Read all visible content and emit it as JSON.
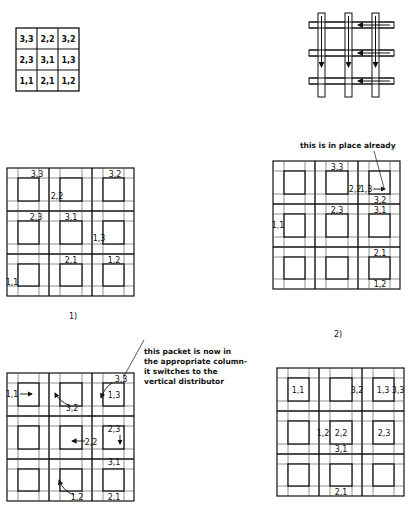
{
  "matrix": {
    "rows": [
      [
        "3,3",
        "2,2",
        "3,2"
      ],
      [
        "2,3",
        "3,1",
        "1,3"
      ],
      [
        "1,1",
        "2,1",
        "1,2"
      ]
    ]
  },
  "crossbar": {
    "description": "3 vertical buses crossed by 3 horizontal buses; horizontal arrows point left, vertical arrows point down"
  },
  "panels": [
    {
      "caption": "1)",
      "packets": [
        {
          "label": "3,3"
        },
        {
          "label": "2,2"
        },
        {
          "label": "3,2"
        },
        {
          "label": "2,3"
        },
        {
          "label": "3,1"
        },
        {
          "label": "1,3"
        },
        {
          "label": "2,1"
        },
        {
          "label": "1,2"
        },
        {
          "label": "1,1"
        }
      ]
    },
    {
      "caption": "2)",
      "annotation": "this is in place already",
      "packets": [
        {
          "label": "3,3"
        },
        {
          "label": "2,2"
        },
        {
          "label": "1,3"
        },
        {
          "label": "3,2"
        },
        {
          "label": "2,3"
        },
        {
          "label": "3,1"
        },
        {
          "label": "1,1"
        },
        {
          "label": "2,1"
        },
        {
          "label": "1,2"
        }
      ]
    },
    {
      "caption": "",
      "annotation": [
        "this packet is now in",
        "the appropriate column-",
        "it switches to the",
        "vertical distributor"
      ],
      "packets": [
        {
          "label": "3,3"
        },
        {
          "label": "1,1"
        },
        {
          "label": "1,3"
        },
        {
          "label": "3,2"
        },
        {
          "label": "2,3"
        },
        {
          "label": "2,2"
        },
        {
          "label": "3,1"
        },
        {
          "label": "1,2"
        },
        {
          "label": "2,1"
        }
      ]
    },
    {
      "caption": "",
      "packets": [
        {
          "label": "1,1"
        },
        {
          "label": "3,2"
        },
        {
          "label": "1,3"
        },
        {
          "label": "3,3"
        },
        {
          "label": "1,2"
        },
        {
          "label": "2,2"
        },
        {
          "label": "2,3"
        },
        {
          "label": "3,1"
        },
        {
          "label": "2,1"
        }
      ]
    }
  ]
}
